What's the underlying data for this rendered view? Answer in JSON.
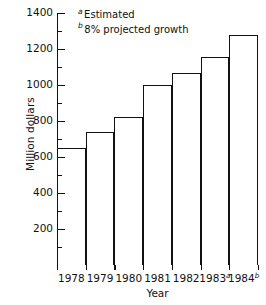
{
  "chart_data": {
    "type": "bar",
    "title": "",
    "xlabel": "Year",
    "ylabel": "Million dollars",
    "categories": [
      "1978",
      "1979",
      "1980",
      "1981",
      "1982",
      "1983",
      "1984"
    ],
    "category_markers": [
      "",
      "",
      "",
      "",
      "",
      "a",
      "b"
    ],
    "values": [
      650,
      740,
      825,
      1000,
      1065,
      1155,
      1280
    ],
    "ylim": [
      0,
      1400
    ],
    "ytick_values": [
      200,
      400,
      600,
      800,
      1000,
      1200,
      1400
    ],
    "ytick_labels": [
      "200",
      "400",
      "600",
      "800",
      "1000",
      "1200",
      "1400"
    ],
    "yminor_step": 100,
    "grid": false,
    "legend_position": "upper-left-inside",
    "annotations": [
      {
        "marker": "a",
        "text": "Estimated"
      },
      {
        "marker": "b",
        "text": "8% projected growth"
      }
    ],
    "colors": {
      "bar_fill": "#ffffff",
      "bar_edge": "#111111",
      "axis": "#111111",
      "text": "#111111",
      "background": "#ffffff"
    }
  }
}
